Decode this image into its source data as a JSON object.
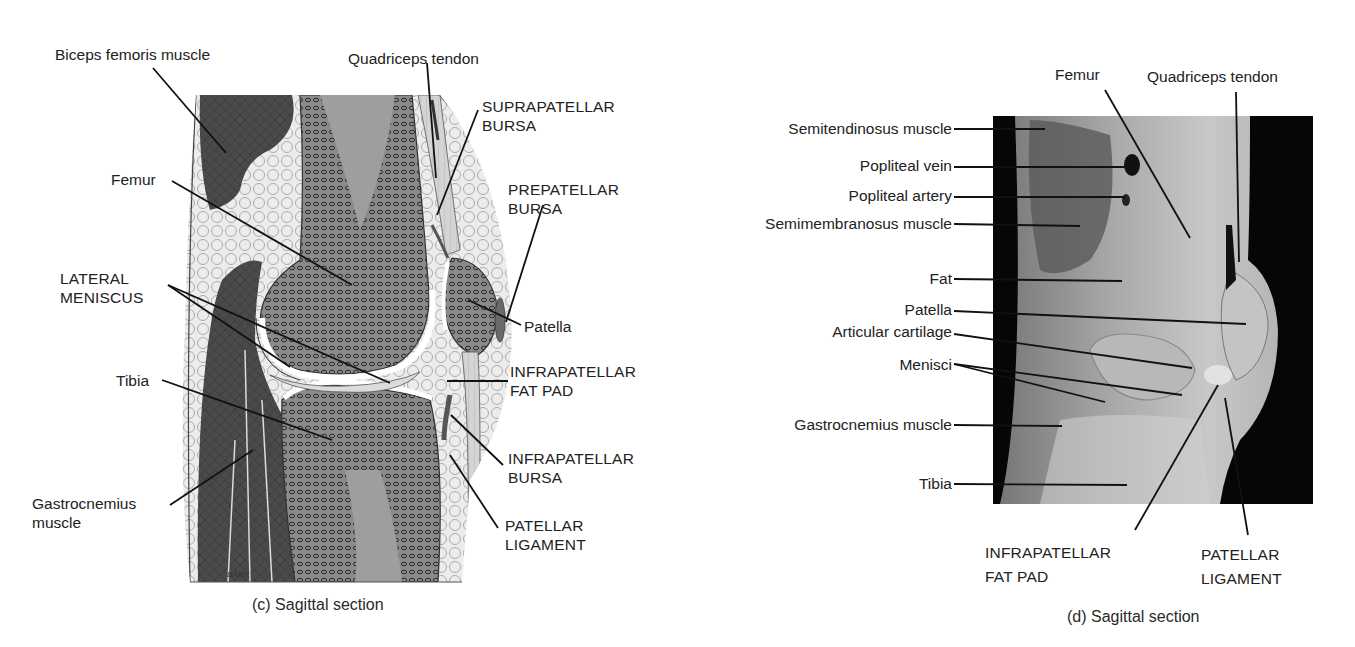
{
  "figure_c": {
    "caption": "(c)  Sagittal section",
    "signature": "DANK",
    "labels": {
      "biceps_femoris": "Biceps femoris muscle",
      "quadriceps_tendon": "Quadriceps tendon",
      "suprapatellar_bursa_1": "SUPRAPATELLAR",
      "suprapatellar_bursa_2": "BURSA",
      "prepatellar_bursa_1": "PREPATELLAR",
      "prepatellar_bursa_2": "BURSA",
      "femur": "Femur",
      "lateral_meniscus_1": "LATERAL",
      "lateral_meniscus_2": "MENISCUS",
      "patella": "Patella",
      "infrapatellar_fat_pad_1": "INFRAPATELLAR",
      "infrapatellar_fat_pad_2": "FAT PAD",
      "tibia": "Tibia",
      "infrapatellar_bursa_1": "INFRAPATELLAR",
      "infrapatellar_bursa_2": "BURSA",
      "gastrocnemius_1": "Gastrocnemius",
      "gastrocnemius_2": "muscle",
      "patellar_ligament_1": "PATELLAR",
      "patellar_ligament_2": "LIGAMENT"
    }
  },
  "figure_d": {
    "caption": "(d)  Sagittal section",
    "labels": {
      "femur": "Femur",
      "quadriceps_tendon": "Quadriceps tendon",
      "semitendinosus": "Semitendinosus muscle",
      "popliteal_vein": "Popliteal vein",
      "popliteal_artery": "Popliteal artery",
      "semimembranosus": "Semimembranosus muscle",
      "fat": "Fat",
      "patella": "Patella",
      "articular_cartilage": "Articular cartilage",
      "menisci": "Menisci",
      "gastrocnemius": "Gastrocnemius muscle",
      "tibia": "Tibia",
      "infrapatellar_fat_pad_1": "INFRAPATELLAR",
      "infrapatellar_fat_pad_2": "FAT PAD",
      "patellar_ligament_1": "PATELLAR",
      "patellar_ligament_2": "LIGAMENT"
    }
  }
}
